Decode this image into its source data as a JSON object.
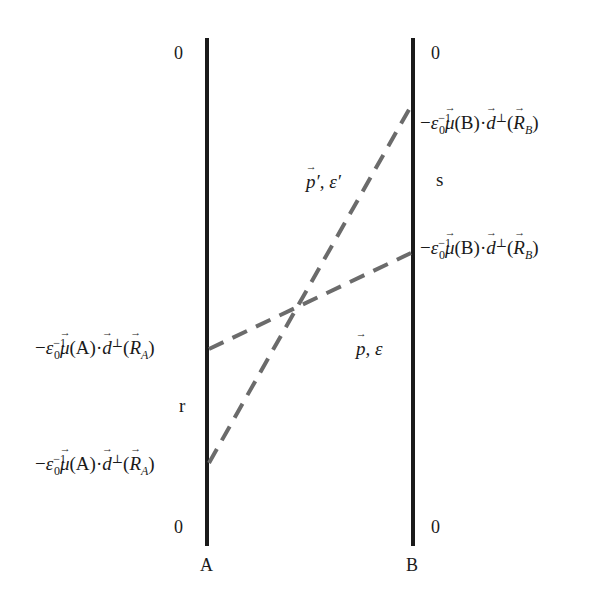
{
  "diagram": {
    "type": "energy-level / transition diagram",
    "axes": {
      "A": {
        "label": "A",
        "top_value": "0",
        "bottom_value": "0",
        "interval_label": "r"
      },
      "B": {
        "label": "B",
        "top_value": "0",
        "bottom_value": "0",
        "interval_label": "s"
      }
    },
    "levels": {
      "A_upper": "−ε₀⁻¹μ(A)·d⊥(R_A)",
      "A_lower": "−ε₀⁻¹μ(A)·d⊥(R_A)",
      "B_upper": "−ε₀⁻¹μ(B)·d⊥(R_B)",
      "B_lower": "−ε₀⁻¹μ(B)·d⊥(R_B)"
    },
    "expr_parts": {
      "minus": "−",
      "eps": "ε",
      "eps_sub": "0",
      "eps_sup": "−1",
      "mu": "μ",
      "A_arg": "(A)",
      "B_arg": "(B)",
      "dot": "·",
      "d": "d",
      "perp": "⊥",
      "open": "(",
      "R": "R",
      "A_sub": "A",
      "B_sub": "B",
      "close": ")"
    },
    "regions": {
      "primed": {
        "p": "p",
        "rest": "′, ε′"
      },
      "unprimed": {
        "p": "p",
        "rest": ", ε"
      }
    },
    "colors": {
      "axis": "#1a1a1a",
      "dashed": "#6b6b6b",
      "background": "#ffffff"
    }
  }
}
